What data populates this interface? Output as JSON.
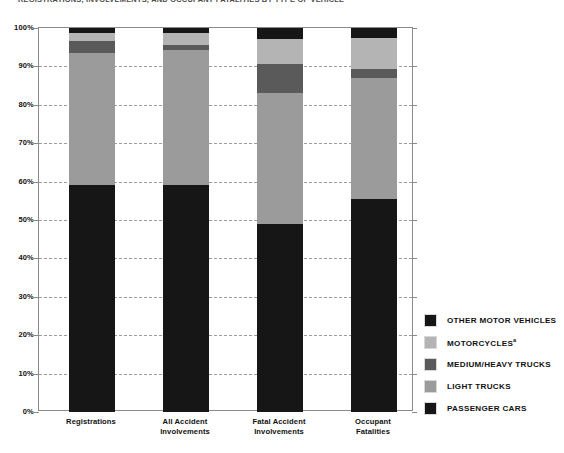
{
  "chart_data": {
    "type": "bar",
    "stacked": true,
    "stacked_mode": "percent",
    "title": "REGISTRATIONS, INVOLVEMENTS, AND OCCUPANT FATALITIES BY TYPE OF VEHICLE",
    "xlabel": "",
    "ylabel": "",
    "ylim": [
      0,
      100
    ],
    "ytick_labels": [
      "0%",
      "10%",
      "20%",
      "30%",
      "40%",
      "50%",
      "60%",
      "70%",
      "80%",
      "90%",
      "100%"
    ],
    "ytick_values": [
      0,
      10,
      20,
      30,
      40,
      50,
      60,
      70,
      80,
      90,
      100
    ],
    "grid": "horizontal-dashed",
    "legend_position": "right",
    "categories": [
      "Registrations",
      "All Accident Involvements",
      "Fatal Accident Involvements",
      "Occupant Fatalities"
    ],
    "series": [
      {
        "name": "PASSENGER CARS",
        "color": "#161616",
        "values": [
          59.0,
          59.2,
          49.0,
          55.5
        ]
      },
      {
        "name": "LIGHT TRUCKS",
        "color": "#9b9b9b",
        "values": [
          34.5,
          35.0,
          34.0,
          31.5
        ]
      },
      {
        "name": "MEDIUM/HEAVY TRUCKS",
        "color": "#5a5a5a",
        "values": [
          3.1,
          1.3,
          7.6,
          2.2
        ]
      },
      {
        "name": "MOTORCYCLES",
        "color": "#b4b4b4",
        "values": [
          2.0,
          3.3,
          6.6,
          8.3
        ]
      },
      {
        "name": "OTHER MOTOR VEHICLES",
        "color": "#161616",
        "values": [
          1.4,
          1.2,
          2.8,
          2.5
        ]
      }
    ]
  },
  "legend": {
    "items": [
      {
        "label": "OTHER MOTOR VEHICLES",
        "superscript": "",
        "color": "#161616"
      },
      {
        "label": "MOTORCYCLES",
        "superscript": "a",
        "color": "#b4b4b4"
      },
      {
        "label": "MEDIUM/HEAVY TRUCKS",
        "superscript": "",
        "color": "#5a5a5a"
      },
      {
        "label": "LIGHT TRUCKS",
        "superscript": "",
        "color": "#9b9b9b"
      },
      {
        "label": "PASSENGER CARS",
        "superscript": "",
        "color": "#161616"
      }
    ]
  },
  "axis": {
    "categories_wrapped": [
      [
        "Registrations",
        ""
      ],
      [
        "All Accident",
        "Involvements"
      ],
      [
        "Fatal Accident",
        "Involvements"
      ],
      [
        "Occupant",
        "Fatalities"
      ]
    ]
  },
  "colors": {
    "grid": "#9d9d9d",
    "frame": "#8a8a8a",
    "text": "#111111",
    "background": "#ffffff"
  }
}
